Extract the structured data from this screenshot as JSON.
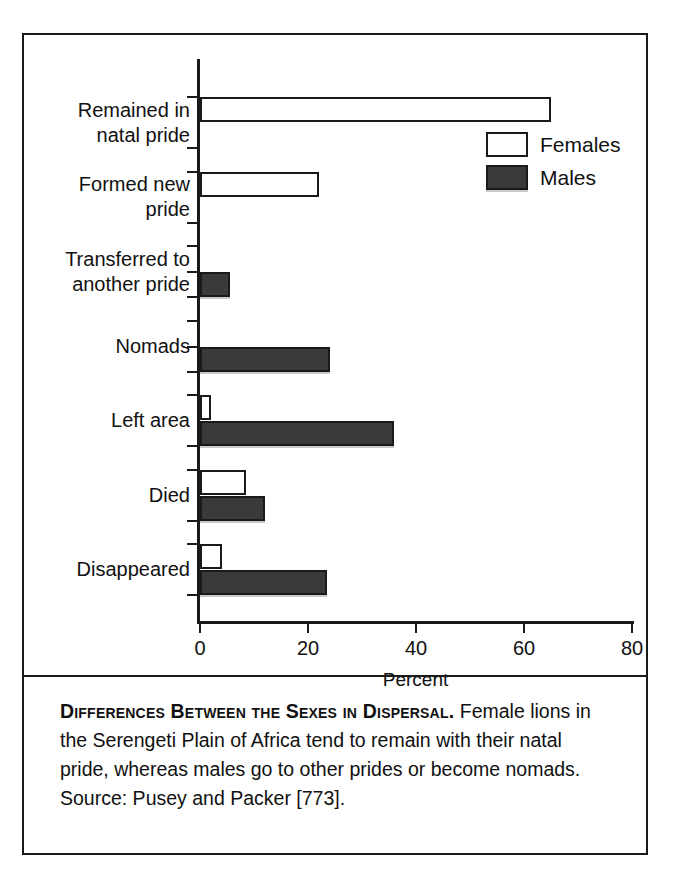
{
  "figure": {
    "caption_title": "Differences Between the Sexes in Dispersal.",
    "caption_body": " Female lions in the Serengeti Plain of Africa tend to remain with their natal pride, whereas males go to other prides or become nomads. Source: Pusey and Packer [773]."
  },
  "legend": {
    "position": "top-right",
    "entries": [
      {
        "label": "Females",
        "swatch": "white-open-square",
        "color": "#ffffff"
      },
      {
        "label": "Males",
        "swatch": "dark-filled-square",
        "color": "#3a3a3a"
      }
    ]
  },
  "axis": {
    "x_title": "Percent",
    "x_ticks": [
      "0",
      "20",
      "40",
      "60",
      "80"
    ]
  },
  "chart_data": {
    "type": "bar",
    "orientation": "horizontal",
    "title": "Differences Between the Sexes in Dispersal",
    "xlabel": "Percent",
    "ylabel": "",
    "xlim": [
      0,
      80
    ],
    "xticks": [
      0,
      20,
      40,
      60,
      80
    ],
    "grid": false,
    "legend_position": "top-right",
    "categories": [
      "Remained in\nnatal pride",
      "Formed new\npride",
      "Transferred to\nanother pride",
      "Nomads",
      "Left area",
      "Died",
      "Disappeared"
    ],
    "series": [
      {
        "name": "Females",
        "color": "#ffffff",
        "values": [
          65,
          22,
          0,
          0,
          2,
          8.5,
          4
        ]
      },
      {
        "name": "Males",
        "color": "#3a3a3a",
        "values": [
          0,
          0,
          5.5,
          24,
          36,
          12,
          23.5
        ]
      }
    ]
  }
}
